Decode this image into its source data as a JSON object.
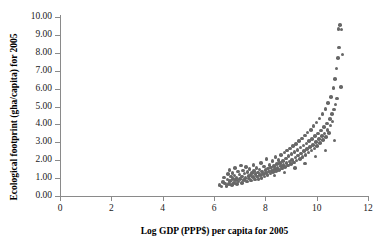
{
  "chart_data": {
    "type": "scatter",
    "title": "",
    "xlabel": "Log GDP (PPP$) per capita for 2005",
    "ylabel": "Ecological footprint (gha/capita) for 2005",
    "xlim": [
      0,
      12
    ],
    "ylim": [
      0,
      10
    ],
    "xticks": [
      0,
      2,
      4,
      6,
      8,
      10,
      12
    ],
    "xtick_labels": [
      "0",
      "2",
      "4",
      "6",
      "8",
      "10",
      "12"
    ],
    "yticks": [
      0,
      1,
      2,
      3,
      4,
      5,
      6,
      7,
      8,
      9,
      10
    ],
    "ytick_labels": [
      "0.00",
      "1.00",
      "2.00",
      "3.00",
      "4.00",
      "5.00",
      "6.00",
      "7.00",
      "8.00",
      "9.00",
      "10.00"
    ],
    "grid": false,
    "legend": null,
    "marker_color": "#676767",
    "marker_size": 3.6,
    "axis_color": "#8a8a8a",
    "background": "#ffffff",
    "n_points": 171,
    "points": [
      [
        6.22,
        0.62
      ],
      [
        6.3,
        0.52
      ],
      [
        6.35,
        0.78
      ],
      [
        6.4,
        1.04
      ],
      [
        6.43,
        0.7
      ],
      [
        6.48,
        0.55
      ],
      [
        6.52,
        0.92
      ],
      [
        6.55,
        1.22
      ],
      [
        6.58,
        0.68
      ],
      [
        6.6,
        1.46
      ],
      [
        6.63,
        0.84
      ],
      [
        6.66,
        1.08
      ],
      [
        6.69,
        0.6
      ],
      [
        6.72,
        1.3
      ],
      [
        6.74,
        0.96
      ],
      [
        6.77,
        0.74
      ],
      [
        6.8,
        1.15
      ],
      [
        6.82,
        1.58
      ],
      [
        6.85,
        0.88
      ],
      [
        6.88,
        1.02
      ],
      [
        6.9,
        0.66
      ],
      [
        6.93,
        1.36
      ],
      [
        6.96,
        0.8
      ],
      [
        6.99,
        1.2
      ],
      [
        7.02,
        0.94
      ],
      [
        7.05,
        1.7
      ],
      [
        7.08,
        1.1
      ],
      [
        7.1,
        0.72
      ],
      [
        7.13,
        1.42
      ],
      [
        7.16,
        0.9
      ],
      [
        7.19,
        1.26
      ],
      [
        7.22,
        1.0
      ],
      [
        7.25,
        1.62
      ],
      [
        7.28,
        0.82
      ],
      [
        7.31,
        1.34
      ],
      [
        7.34,
        1.12
      ],
      [
        7.36,
        0.98
      ],
      [
        7.39,
        1.5
      ],
      [
        7.42,
        1.18
      ],
      [
        7.45,
        0.86
      ],
      [
        7.48,
        1.28
      ],
      [
        7.51,
        1.06
      ],
      [
        7.54,
        1.74
      ],
      [
        7.57,
        1.4
      ],
      [
        7.6,
        0.92
      ],
      [
        7.62,
        1.22
      ],
      [
        7.65,
        1.56
      ],
      [
        7.68,
        1.08
      ],
      [
        7.71,
        1.32
      ],
      [
        7.74,
        0.96
      ],
      [
        7.77,
        1.48
      ],
      [
        7.8,
        1.16
      ],
      [
        7.83,
        1.86
      ],
      [
        7.85,
        1.02
      ],
      [
        7.88,
        1.38
      ],
      [
        7.91,
        1.24
      ],
      [
        7.94,
        1.64
      ],
      [
        7.97,
        1.1
      ],
      [
        8.0,
        1.44
      ],
      [
        8.03,
        1.3
      ],
      [
        8.05,
        2.06
      ],
      [
        8.08,
        1.18
      ],
      [
        8.11,
        1.54
      ],
      [
        8.14,
        1.36
      ],
      [
        8.17,
        1.72
      ],
      [
        8.2,
        1.26
      ],
      [
        8.22,
        1.6
      ],
      [
        8.25,
        1.42
      ],
      [
        8.28,
        1.94
      ],
      [
        8.31,
        1.34
      ],
      [
        8.34,
        1.68
      ],
      [
        8.37,
        1.5
      ],
      [
        8.4,
        2.18
      ],
      [
        8.42,
        1.4
      ],
      [
        8.45,
        1.78
      ],
      [
        8.48,
        1.58
      ],
      [
        8.51,
        2.02
      ],
      [
        8.54,
        1.46
      ],
      [
        8.57,
        1.86
      ],
      [
        8.6,
        1.66
      ],
      [
        8.62,
        2.3
      ],
      [
        8.65,
        1.54
      ],
      [
        8.68,
        1.96
      ],
      [
        8.71,
        1.74
      ],
      [
        8.74,
        2.42
      ],
      [
        8.77,
        1.62
      ],
      [
        8.8,
        2.1
      ],
      [
        8.82,
        1.84
      ],
      [
        8.85,
        2.54
      ],
      [
        8.88,
        1.7
      ],
      [
        8.91,
        2.22
      ],
      [
        8.94,
        1.92
      ],
      [
        8.97,
        2.66
      ],
      [
        9.0,
        1.78
      ],
      [
        9.02,
        2.34
      ],
      [
        9.05,
        2.02
      ],
      [
        9.08,
        2.78
      ],
      [
        9.11,
        1.88
      ],
      [
        9.14,
        2.46
      ],
      [
        9.17,
        2.14
      ],
      [
        9.2,
        2.9
      ],
      [
        9.22,
        1.98
      ],
      [
        9.25,
        2.58
      ],
      [
        9.28,
        2.26
      ],
      [
        9.31,
        3.06
      ],
      [
        9.34,
        2.08
      ],
      [
        9.37,
        2.7
      ],
      [
        9.4,
        2.38
      ],
      [
        9.42,
        3.22
      ],
      [
        9.45,
        2.18
      ],
      [
        9.48,
        2.82
      ],
      [
        9.51,
        2.5
      ],
      [
        9.54,
        3.38
      ],
      [
        9.57,
        2.3
      ],
      [
        9.6,
        2.94
      ],
      [
        9.62,
        2.62
      ],
      [
        9.65,
        3.54
      ],
      [
        9.68,
        2.42
      ],
      [
        9.71,
        3.06
      ],
      [
        9.74,
        2.74
      ],
      [
        9.77,
        3.7
      ],
      [
        9.8,
        2.54
      ],
      [
        9.82,
        3.18
      ],
      [
        9.85,
        2.86
      ],
      [
        9.88,
        3.9
      ],
      [
        9.91,
        2.66
      ],
      [
        9.94,
        3.34
      ],
      [
        9.97,
        3.02
      ],
      [
        10.0,
        4.1
      ],
      [
        10.02,
        2.8
      ],
      [
        10.05,
        3.5
      ],
      [
        10.08,
        3.18
      ],
      [
        10.11,
        4.34
      ],
      [
        10.14,
        2.96
      ],
      [
        10.17,
        3.66
      ],
      [
        10.2,
        3.34
      ],
      [
        10.22,
        4.58
      ],
      [
        10.25,
        3.12
      ],
      [
        10.28,
        3.86
      ],
      [
        10.31,
        3.5
      ],
      [
        10.34,
        4.86
      ],
      [
        10.37,
        3.3
      ],
      [
        10.4,
        4.06
      ],
      [
        10.42,
        3.7
      ],
      [
        10.45,
        5.18
      ],
      [
        10.48,
        3.52
      ],
      [
        10.51,
        4.3
      ],
      [
        10.54,
        3.94
      ],
      [
        10.57,
        5.54
      ],
      [
        10.6,
        4.58
      ],
      [
        10.62,
        4.16
      ],
      [
        10.65,
        6.02
      ],
      [
        10.68,
        4.84
      ],
      [
        10.71,
        6.52
      ],
      [
        10.74,
        5.12
      ],
      [
        10.77,
        7.12
      ],
      [
        10.8,
        5.44
      ],
      [
        10.82,
        7.7
      ],
      [
        10.85,
        9.34
      ],
      [
        10.88,
        8.3
      ],
      [
        10.91,
        9.56
      ],
      [
        10.94,
        6.1
      ],
      [
        10.97,
        9.3
      ],
      [
        11.0,
        7.9
      ],
      [
        10.7,
        3.1
      ],
      [
        10.35,
        2.54
      ],
      [
        9.96,
        2.2
      ],
      [
        9.55,
        1.82
      ],
      [
        9.15,
        1.56
      ],
      [
        8.75,
        1.32
      ],
      [
        8.35,
        1.14
      ]
    ]
  }
}
